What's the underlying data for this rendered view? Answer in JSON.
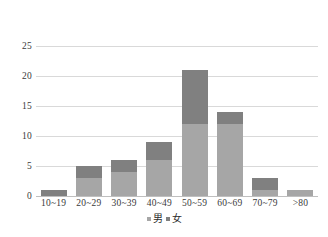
{
  "chart_data": {
    "type": "bar",
    "subtype": "stacked-column",
    "title": "",
    "subtitle": "",
    "xlabel": "",
    "ylabel": "",
    "categories": [
      "10~19",
      "20~29",
      "30~39",
      "40~49",
      "50~59",
      "60~69",
      "70~79",
      ">80"
    ],
    "series": [
      {
        "name": "男",
        "values": [
          0,
          3,
          4,
          6,
          12,
          12,
          1,
          1
        ],
        "color": "#a6a6a6"
      },
      {
        "name": "女",
        "values": [
          1,
          2,
          2,
          3,
          9,
          2,
          2,
          0
        ],
        "color": "#808080"
      }
    ],
    "totals": [
      1,
      5,
      6,
      9,
      21,
      14,
      3,
      1
    ],
    "ylim": [
      0,
      25
    ],
    "yticks": [
      0,
      5,
      10,
      15,
      20,
      25
    ],
    "ytick_labels": [
      "0",
      "5",
      "10",
      "15",
      "20",
      "25"
    ],
    "grid": "horizontal",
    "legend_position": "bottom",
    "legend": [
      {
        "label": "男",
        "color": "#a6a6a6"
      },
      {
        "label": "女",
        "color": "#808080"
      }
    ],
    "colors": {
      "male": "#a6a6a6",
      "female": "#808080",
      "gridline": "#d9d9d9",
      "axis": "#bfbfbf",
      "text": "#3a3a3a",
      "background": "#ffffff"
    }
  }
}
